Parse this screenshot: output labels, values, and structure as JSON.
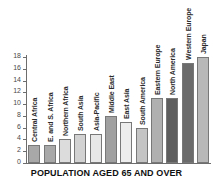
{
  "chart_data": {
    "type": "bar",
    "title": "POPULATION AGED 65 AND OVER",
    "xlabel": "",
    "ylabel": "",
    "ylim": [
      0,
      18
    ],
    "ytick_step": 2,
    "yticks": [
      "18",
      "16",
      "14",
      "12",
      "10",
      "8",
      "6",
      "4",
      "2",
      "0"
    ],
    "grid": false,
    "legend": "none",
    "categories": [
      "Central Africa",
      "E. and S. Africa",
      "Northern Africa",
      "South Asia",
      "Asia-Pacific",
      "Middle East",
      "East Asia",
      "South America",
      "Eastern Europe",
      "North America",
      "Western Europe",
      "Japan"
    ],
    "values": [
      3,
      3,
      4,
      5,
      5,
      8,
      7,
      6,
      11,
      11,
      17,
      18
    ],
    "bar_colors": [
      "#a8a8a8",
      "#a8a8a8",
      "#dcdcdc",
      "#d2d2d2",
      "#e8e8e8",
      "#a0a0a0",
      "#ededed",
      "#c4c4c4",
      "#b0b0b0",
      "#5e5e5e",
      "#6b6b6b",
      "#b8b8b8"
    ]
  },
  "axis": {
    "line_color": "#6d6d6d",
    "label_color": "#4a4a4a"
  }
}
